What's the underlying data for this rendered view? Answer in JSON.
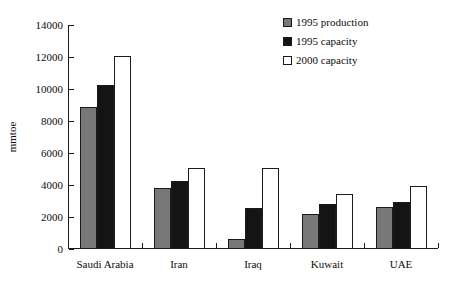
{
  "chart_data": {
    "type": "bar",
    "title": "",
    "xlabel": "",
    "ylabel": "mmtoe",
    "ylim": [
      0,
      14000
    ],
    "ytick_values": [
      0,
      2000,
      4000,
      6000,
      8000,
      10000,
      12000,
      14000
    ],
    "ytick_labels": [
      "0",
      "2000",
      "4000",
      "6000",
      "8000",
      "10000",
      "12000",
      "14000"
    ],
    "grid": false,
    "legend_position": "top-right",
    "categories": [
      "Saudi Arabia",
      "Iran",
      "Iraq",
      "Kuwait",
      "UAE"
    ],
    "series": [
      {
        "name": "1995 production",
        "color": "#787878",
        "values": [
          8800,
          3750,
          550,
          2100,
          2550
        ]
      },
      {
        "name": "1995 capacity",
        "color": "#141414",
        "values": [
          10200,
          4200,
          2500,
          2750,
          2900
        ]
      },
      {
        "name": "2000 capacity",
        "color": "#ffffff",
        "values": [
          12000,
          5000,
          5000,
          3350,
          3850
        ]
      }
    ]
  },
  "legend": {
    "entries": [
      {
        "label": "1995 production",
        "swatch": "gray"
      },
      {
        "label": "1995 capacity",
        "swatch": "black"
      },
      {
        "label": "2000 capacity",
        "swatch": "white"
      }
    ]
  },
  "axis": {
    "y_title": "mmtoe"
  },
  "colors": {
    "series_1995_production": "#787878",
    "series_1995_capacity": "#141414",
    "series_2000_capacity": "#ffffff",
    "axis": "#1a1a1a",
    "text": "#0d0d0d",
    "background": "#ffffff"
  }
}
